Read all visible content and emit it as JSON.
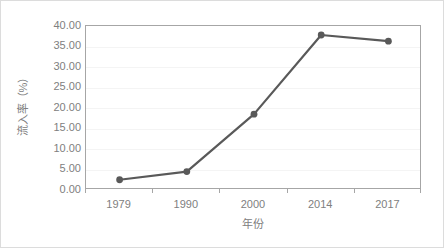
{
  "chart_data": {
    "type": "line",
    "title": "",
    "subtitle": "",
    "xlabel": "年份",
    "ylabel": "流入率（%）",
    "categories": [
      "1979",
      "1990",
      "2000",
      "2014",
      "2017"
    ],
    "values": [
      2.5,
      4.5,
      18.5,
      37.8,
      36.3
    ],
    "series": [
      {
        "name": "流入率",
        "values": [
          2.5,
          4.5,
          18.5,
          37.8,
          36.3
        ]
      }
    ],
    "ylim": [
      0,
      40
    ],
    "ytick_step": 5,
    "ytick_labels": [
      "40.00",
      "35.00",
      "30.00",
      "25.00",
      "20.00",
      "15.00",
      "10.00",
      "5.00",
      "0.00"
    ],
    "ytick_values": [
      40,
      35,
      30,
      25,
      20,
      15,
      10,
      5,
      0
    ],
    "xtick_labels": [
      "1979",
      "1990",
      "2000",
      "2014",
      "2017"
    ],
    "grid": true,
    "grid_axis": "y",
    "legend": false,
    "legend_position": "none",
    "markers": true,
    "marker_shape": "circle",
    "colors": {
      "line": "#595959",
      "marker": "#595959",
      "grid": "#f4f4f4",
      "axis": "#a6a6a6",
      "text": "#808080",
      "frame": "#dcdcdc",
      "background": "#ffffff"
    }
  }
}
